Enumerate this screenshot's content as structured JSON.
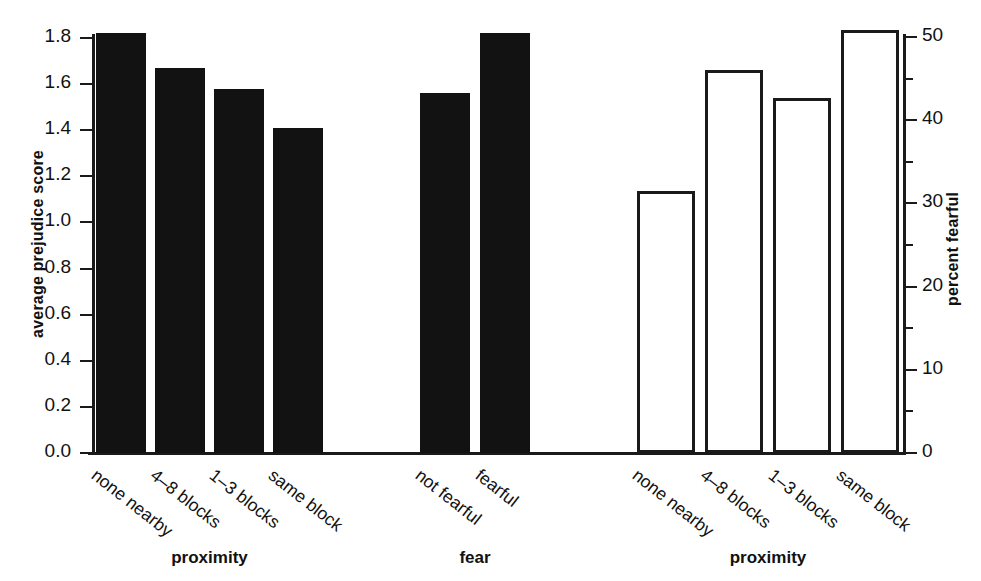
{
  "chart_data": {
    "type": "bar",
    "title": "",
    "subtitle": "",
    "grid": false,
    "legend": null,
    "panels": [
      {
        "group_label": "proximity",
        "axis": "left",
        "bar_style": "filled",
        "categories": [
          "none nearby",
          "4–8 blocks",
          "1–3 blocks",
          "same block"
        ],
        "values": [
          1.82,
          1.67,
          1.58,
          1.41
        ]
      },
      {
        "group_label": "fear",
        "axis": "left",
        "bar_style": "filled",
        "categories": [
          "not fearful",
          "fearful"
        ],
        "values": [
          1.56,
          1.82
        ]
      },
      {
        "group_label": "proximity",
        "axis": "right",
        "bar_style": "hollow",
        "categories": [
          "none nearby",
          "4–8 blocks",
          "1–3 blocks",
          "same block"
        ],
        "values": [
          31.5,
          46.0,
          42.7,
          50.8
        ]
      }
    ],
    "axes": {
      "left": {
        "label": "average prejudice score",
        "ylim": [
          0.0,
          1.8
        ],
        "ticks": [
          0.0,
          0.2,
          0.4,
          0.6,
          0.8,
          1.0,
          1.2,
          1.4,
          1.6,
          1.8
        ],
        "ticklabels": [
          "0.0",
          "0.2",
          "0.4",
          "0.6",
          "0.8",
          "1.0",
          "1.2",
          "1.4",
          "1.6",
          "1.8"
        ]
      },
      "right": {
        "label": "percent fearful",
        "ylim": [
          0,
          52
        ],
        "ticks": [
          0,
          10,
          20,
          30,
          40,
          50
        ],
        "minor_ticks": [
          5,
          15,
          25,
          35,
          45
        ],
        "ticklabels": [
          "0",
          "10",
          "20",
          "30",
          "40",
          "50"
        ]
      }
    },
    "colors": {
      "bar_filled": "#121212",
      "bar_hollow_fill": "#ffffff",
      "bar_outline": "#1a1a1a",
      "axis": "#1a1a1a",
      "text": "#111111",
      "background": "#ffffff"
    }
  }
}
